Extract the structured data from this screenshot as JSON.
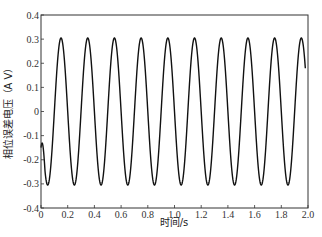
{
  "chart_data": {
    "type": "line",
    "title": "",
    "xlabel": "时间/s",
    "ylabel": "相位误差电压（A V）",
    "xlim": [
      0,
      2.0
    ],
    "ylim": [
      -0.4,
      0.4
    ],
    "xticks": [
      0,
      0.2,
      0.4,
      0.6,
      0.8,
      1.0,
      1.2,
      1.4,
      1.6,
      1.8,
      2.0
    ],
    "xtick_labels": [
      "0",
      "0.2",
      "0.4",
      "0.6",
      "0.8",
      "1.0",
      "1.2",
      "1.4",
      "1.6",
      "1.8",
      "2.0"
    ],
    "yticks": [
      0.4,
      0.3,
      0.2,
      0.1,
      0,
      -0.1,
      -0.2,
      -0.3,
      -0.4
    ],
    "ytick_labels": [
      "0.4",
      "0.3",
      "0.2",
      "0.1",
      "0",
      "-0.1",
      "-0.2",
      "-0.3",
      "-0.4"
    ],
    "grid": false,
    "legend": null,
    "series": [
      {
        "name": "相位误差电压",
        "color": "#111111",
        "description": "Near-sinusoidal oscillation, amplitude ~0.305 V, period ~0.2 s (5 Hz), first trough at t≈0.05 s, 10 peaks at t≈0.15+0.2k s",
        "amplitude": 0.305,
        "frequency_hz": 5,
        "x": [
          0,
          0.025,
          0.05,
          0.075,
          0.1,
          0.125,
          0.15,
          0.175,
          0.2,
          0.225,
          0.25,
          0.275,
          0.3,
          0.325,
          0.35,
          0.375,
          0.4,
          0.425,
          0.45,
          0.475,
          0.5,
          0.525,
          0.55,
          0.575,
          0.6,
          0.625,
          0.65,
          0.675,
          0.7,
          0.725,
          0.75,
          0.775,
          0.8,
          0.825,
          0.85,
          0.875,
          0.9,
          0.925,
          0.95,
          0.975,
          1.0,
          1.025,
          1.05,
          1.075,
          1.1,
          1.125,
          1.15,
          1.175,
          1.2,
          1.225,
          1.25,
          1.275,
          1.3,
          1.325,
          1.35,
          1.375,
          1.4,
          1.425,
          1.45,
          1.475,
          1.5,
          1.525,
          1.55,
          1.575,
          1.6,
          1.625,
          1.65,
          1.675,
          1.7,
          1.725,
          1.75,
          1.775,
          1.8,
          1.825,
          1.85,
          1.875,
          1.9,
          1.925,
          1.95,
          1.975
        ],
        "values": [
          -0.15,
          -0.275,
          -0.305,
          -0.216,
          0.0,
          0.216,
          0.305,
          0.216,
          0.0,
          -0.216,
          -0.305,
          -0.216,
          0.0,
          0.216,
          0.305,
          0.216,
          0.0,
          -0.216,
          -0.305,
          -0.216,
          0.0,
          0.216,
          0.305,
          0.216,
          0.0,
          -0.216,
          -0.305,
          -0.216,
          0.0,
          0.216,
          0.305,
          0.216,
          0.0,
          -0.216,
          -0.305,
          -0.216,
          0.0,
          0.216,
          0.305,
          0.216,
          0.0,
          -0.216,
          -0.305,
          -0.216,
          0.0,
          0.216,
          0.305,
          0.216,
          0.0,
          -0.216,
          -0.305,
          -0.216,
          0.0,
          0.216,
          0.305,
          0.216,
          0.0,
          -0.216,
          -0.305,
          -0.216,
          0.0,
          0.216,
          0.305,
          0.216,
          0.0,
          -0.216,
          -0.305,
          -0.216,
          0.0,
          0.216,
          0.305,
          0.216,
          0.0,
          -0.216,
          -0.305,
          -0.216,
          0.0,
          0.216,
          0.305,
          0.216
        ]
      }
    ]
  }
}
